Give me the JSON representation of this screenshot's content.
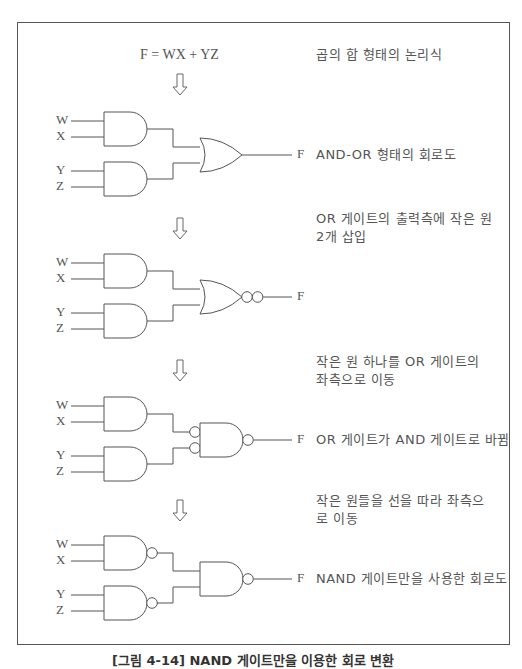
{
  "figure": {
    "caption": "[그림 4-14] NAND 게이트만을 이용한 회로 변환",
    "formula": "F = WX + YZ",
    "formula_note": "곱의 합 형태의 논리식",
    "inputs": [
      "W",
      "X",
      "Y",
      "Z"
    ],
    "output": "F",
    "steps": [
      {
        "id": "and-or",
        "top": 112,
        "note_above": "",
        "note_side": "AND-OR 형태의 회로도",
        "first_level": "AND",
        "input_bubbles": false,
        "second_level": "OR",
        "second_input_bubbles": false,
        "output_bubbles": 0
      },
      {
        "id": "double-bubble",
        "top": 254,
        "note_above": "OR 게이트의 출력측에 작은 원 2개 삽입",
        "note_side": "",
        "first_level": "AND",
        "input_bubbles": false,
        "second_level": "OR",
        "second_input_bubbles": false,
        "output_bubbles": 2
      },
      {
        "id": "moved-bubble",
        "top": 397,
        "note_above": "작은 원 하나를 OR 게이트의 좌측으로 이동",
        "note_side": "OR 게이트가 AND 게이트로 바뀜",
        "first_level": "AND",
        "input_bubbles": false,
        "second_level": "AND",
        "second_input_bubbles": true,
        "output_bubbles": 1
      },
      {
        "id": "nand-only",
        "top": 536,
        "note_above": "작은 원들을 선을 따라 좌측으로 이동",
        "note_side": "NAND 게이트만을 사용한 회로도",
        "first_level": "NAND",
        "input_bubbles": false,
        "second_level": "AND",
        "second_input_bubbles": false,
        "output_bubbles": 1
      }
    ],
    "arrows_y": [
      74,
      218,
      360,
      500
    ]
  }
}
